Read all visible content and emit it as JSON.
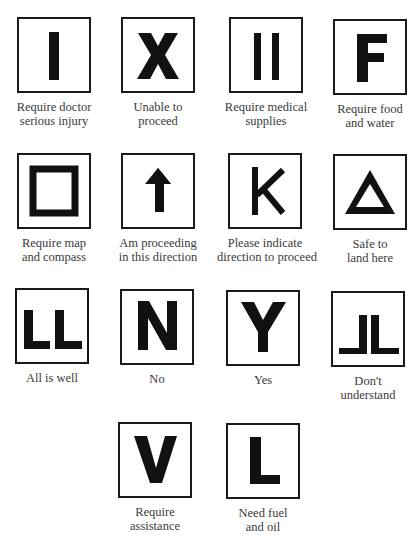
{
  "colors": {
    "ink": "#111111",
    "border": "#1a1a1a",
    "caption": "#3a3a3a",
    "background": "#ffffff"
  },
  "signals": [
    {
      "symbol": "I",
      "icon": "single-bar-icon",
      "caption": [
        "Require doctor",
        "serious injury"
      ]
    },
    {
      "symbol": "X",
      "icon": "x-icon",
      "caption": [
        "Unable to",
        "proceed"
      ]
    },
    {
      "symbol": "II",
      "icon": "double-bar-icon",
      "caption": [
        "Require medical",
        "supplies"
      ]
    },
    {
      "symbol": "F",
      "icon": "letter-f-icon",
      "caption": [
        "Require food",
        "and water"
      ]
    },
    {
      "symbol": "□",
      "icon": "square-icon",
      "caption": [
        "Require map",
        "and compass"
      ]
    },
    {
      "symbol": "↑",
      "icon": "arrow-up-icon",
      "caption": [
        "Am proceeding",
        "in this direction"
      ]
    },
    {
      "symbol": "K",
      "icon": "letter-k-icon",
      "caption": [
        "Please indicate",
        "direction to proceed"
      ]
    },
    {
      "symbol": "△",
      "icon": "triangle-icon",
      "caption": [
        "Safe to",
        "land here"
      ]
    },
    {
      "symbol": "LL",
      "icon": "double-l-icon",
      "caption": [
        "All is well",
        ""
      ]
    },
    {
      "symbol": "N",
      "icon": "letter-n-icon",
      "caption": [
        "No",
        ""
      ]
    },
    {
      "symbol": "Y",
      "icon": "letter-y-icon",
      "caption": [
        "Yes",
        ""
      ]
    },
    {
      "symbol": "JL",
      "icon": "mirrored-l-icon",
      "caption": [
        "Don't",
        "understand"
      ]
    },
    {
      "symbol": "V",
      "icon": "letter-v-icon",
      "caption": [
        "Require",
        "assistance"
      ]
    },
    {
      "symbol": "L",
      "icon": "letter-l-icon",
      "caption": [
        "Need fuel",
        "and oil"
      ]
    }
  ]
}
